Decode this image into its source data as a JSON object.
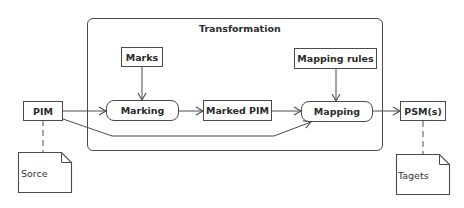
{
  "diagram": {
    "container": {
      "title": "Transformation"
    },
    "nodes": {
      "pim": "PIM",
      "marks": "Marks",
      "marking": "Marking",
      "marked_pim": "Marked PIM",
      "mapping_rules": "Mapping rules",
      "mapping": "Mapping",
      "psm": "PSM(s)"
    },
    "notes": {
      "source": "Sorce",
      "targets": "Tagets"
    },
    "edges": [
      {
        "from": "PIM",
        "to": "Marking",
        "style": "solid-arrow"
      },
      {
        "from": "PIM",
        "to": "Mapping",
        "style": "solid-arrow"
      },
      {
        "from": "Marks",
        "to": "Marking",
        "style": "solid-arrow"
      },
      {
        "from": "Marking",
        "to": "Marked PIM",
        "style": "solid-arrow"
      },
      {
        "from": "Marked PIM",
        "to": "Mapping",
        "style": "solid-arrow"
      },
      {
        "from": "Mapping rules",
        "to": "Mapping",
        "style": "solid-arrow"
      },
      {
        "from": "Mapping",
        "to": "PSM(s)",
        "style": "solid-arrow"
      },
      {
        "from": "PIM",
        "to": "Sorce",
        "style": "dashed"
      },
      {
        "from": "PSM(s)",
        "to": "Tagets",
        "style": "dashed"
      }
    ]
  }
}
